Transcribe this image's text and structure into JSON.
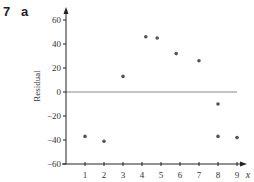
{
  "question": {
    "number": "7",
    "part": "a"
  },
  "chart_data": {
    "type": "scatter",
    "title": "",
    "xlabel": "x",
    "ylabel": "Residual",
    "xlim": [
      0,
      9.6
    ],
    "ylim": [
      -60,
      70
    ],
    "x_ticks": [
      1,
      2,
      3,
      4,
      5,
      6,
      7,
      8,
      9
    ],
    "y_ticks": [
      60,
      40,
      20,
      0,
      -20,
      -40,
      -60
    ],
    "grid": false,
    "reference_line": {
      "y": 0,
      "x_from": 0,
      "x_to": 9
    },
    "series": [
      {
        "name": "Residuals",
        "points": [
          {
            "x": 1,
            "y": -37
          },
          {
            "x": 2,
            "y": -41
          },
          {
            "x": 3,
            "y": 13
          },
          {
            "x": 4.2,
            "y": 46
          },
          {
            "x": 4.8,
            "y": 45
          },
          {
            "x": 5.8,
            "y": 32
          },
          {
            "x": 7,
            "y": 26
          },
          {
            "x": 8,
            "y": -10
          },
          {
            "x": 8,
            "y": -37
          },
          {
            "x": 9,
            "y": -38
          }
        ]
      }
    ],
    "colors": {
      "axis": "#222222",
      "points": "#555555",
      "reference_line": "#888888"
    }
  }
}
